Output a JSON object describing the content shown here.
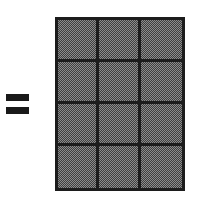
{
  "figure": {
    "type": "area-model-fraction-diagram",
    "background_color": "#ffffff",
    "operator": {
      "symbol": "=",
      "name": "equals-sign",
      "color": "#1a1a1a",
      "bar_count": 2
    },
    "grid": {
      "columns": 3,
      "rows": 4,
      "total_cells": 12,
      "shaded_cells": 12,
      "fill_color": "#8c8c8c",
      "fill_pattern": "checkerboard-dither-halftone",
      "line_color": "#1c1c1c",
      "line_thickness_px": 3,
      "cells": [
        {
          "row": 1,
          "col": 1,
          "shaded": true
        },
        {
          "row": 1,
          "col": 2,
          "shaded": true
        },
        {
          "row": 1,
          "col": 3,
          "shaded": true
        },
        {
          "row": 2,
          "col": 1,
          "shaded": true
        },
        {
          "row": 2,
          "col": 2,
          "shaded": true
        },
        {
          "row": 2,
          "col": 3,
          "shaded": true
        },
        {
          "row": 3,
          "col": 1,
          "shaded": true
        },
        {
          "row": 3,
          "col": 2,
          "shaded": true
        },
        {
          "row": 3,
          "col": 3,
          "shaded": true
        },
        {
          "row": 4,
          "col": 1,
          "shaded": true
        },
        {
          "row": 4,
          "col": 2,
          "shaded": true
        },
        {
          "row": 4,
          "col": 3,
          "shaded": true
        }
      ]
    }
  }
}
